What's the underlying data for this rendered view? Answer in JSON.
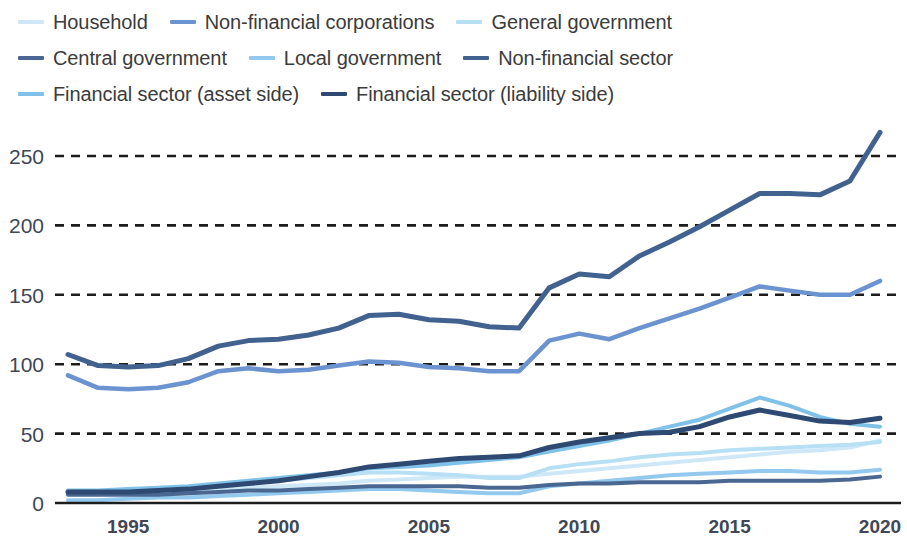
{
  "chart_data": {
    "type": "line",
    "title": "",
    "xlabel": "",
    "ylabel": "",
    "xlim": [
      1993,
      2020
    ],
    "ylim": [
      0,
      280
    ],
    "yticks": [
      0,
      50,
      100,
      150,
      200,
      250
    ],
    "xticks": [
      1995,
      2000,
      2005,
      2010,
      2015,
      2020
    ],
    "grid": true,
    "grid_style": "dashed-black",
    "legend_position": "top",
    "x": [
      1993,
      1994,
      1995,
      1996,
      1997,
      1998,
      1999,
      2000,
      2001,
      2002,
      2003,
      2004,
      2005,
      2006,
      2007,
      2008,
      2009,
      2010,
      2011,
      2012,
      2013,
      2014,
      2015,
      2016,
      2017,
      2018,
      2019,
      2020
    ],
    "series": [
      {
        "name": "Household",
        "color": "#cfe8f7",
        "values": [
          7,
          7,
          8,
          8,
          9,
          10,
          11,
          12,
          13,
          14,
          16,
          17,
          18,
          19,
          19,
          19,
          21,
          23,
          25,
          27,
          29,
          31,
          33,
          35,
          37,
          38,
          40,
          45
        ]
      },
      {
        "name": "Non-financial corporations",
        "color": "#6b93cf",
        "values": [
          92,
          83,
          82,
          83,
          87,
          95,
          97,
          95,
          96,
          99,
          102,
          101,
          98,
          97,
          95,
          95,
          117,
          122,
          118,
          126,
          133,
          140,
          148,
          156,
          153,
          150,
          150,
          160
        ]
      },
      {
        "name": "General government",
        "color": "#b7e0f5",
        "values": [
          8,
          8,
          9,
          10,
          11,
          13,
          15,
          16,
          18,
          20,
          22,
          22,
          21,
          20,
          18,
          18,
          25,
          28,
          30,
          33,
          35,
          36,
          38,
          39,
          40,
          41,
          42,
          44
        ]
      },
      {
        "name": "Central government",
        "color": "#4a6792",
        "values": [
          6,
          6,
          6,
          6,
          7,
          8,
          9,
          9,
          10,
          11,
          12,
          12,
          12,
          12,
          11,
          11,
          13,
          14,
          14,
          15,
          15,
          15,
          16,
          16,
          16,
          16,
          17,
          19
        ]
      },
      {
        "name": "Local government",
        "color": "#93c9ef",
        "values": [
          2,
          2,
          3,
          4,
          4,
          5,
          6,
          7,
          8,
          9,
          10,
          10,
          9,
          8,
          7,
          7,
          12,
          14,
          16,
          18,
          20,
          21,
          22,
          23,
          23,
          22,
          22,
          24
        ]
      },
      {
        "name": "Non-financial sector",
        "color": "#41618f",
        "values": [
          107,
          99,
          98,
          99,
          104,
          113,
          117,
          118,
          121,
          126,
          135,
          136,
          132,
          131,
          127,
          126,
          155,
          165,
          163,
          178,
          188,
          199,
          211,
          223,
          223,
          222,
          232,
          267
        ]
      },
      {
        "name": "Financial sector (asset side)",
        "color": "#7fc1e8",
        "values": [
          9,
          9,
          10,
          11,
          12,
          14,
          16,
          18,
          20,
          22,
          25,
          26,
          27,
          29,
          31,
          33,
          37,
          41,
          45,
          50,
          55,
          60,
          68,
          76,
          70,
          62,
          57,
          55
        ]
      },
      {
        "name": "Financial sector (liability side)",
        "color": "#2e4a73",
        "values": [
          8,
          8,
          8,
          9,
          10,
          12,
          14,
          16,
          19,
          22,
          26,
          28,
          30,
          32,
          33,
          34,
          40,
          44,
          47,
          50,
          51,
          55,
          62,
          67,
          63,
          59,
          58,
          61
        ]
      }
    ]
  }
}
